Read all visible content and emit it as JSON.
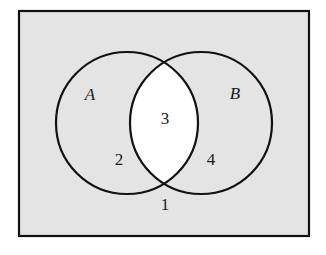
{
  "diagram": {
    "type": "venn",
    "colors": {
      "page_background": "#ffffff",
      "universe_fill": "#e4e4e4",
      "intersection_fill": "#ffffff",
      "stroke": "#111111"
    },
    "universe": {
      "x": 19,
      "y": 11,
      "width": 290,
      "height": 225
    },
    "sets": [
      {
        "label": "A",
        "cx": 127,
        "cy": 123,
        "r": 71,
        "label_x": 90,
        "label_y": 100
      },
      {
        "label": "B",
        "cx": 201,
        "cy": 123,
        "r": 71,
        "label_x": 235,
        "label_y": 99
      }
    ],
    "regions": [
      {
        "label": "1",
        "description": "outside A and B",
        "x": 165,
        "y": 210
      },
      {
        "label": "2",
        "description": "A only",
        "x": 119,
        "y": 165
      },
      {
        "label": "3",
        "description": "A and B",
        "x": 165,
        "y": 124
      },
      {
        "label": "4",
        "description": "B only",
        "x": 211,
        "y": 165
      }
    ],
    "shaded": "intersection unshaded (white), all other regions shaded gray"
  }
}
